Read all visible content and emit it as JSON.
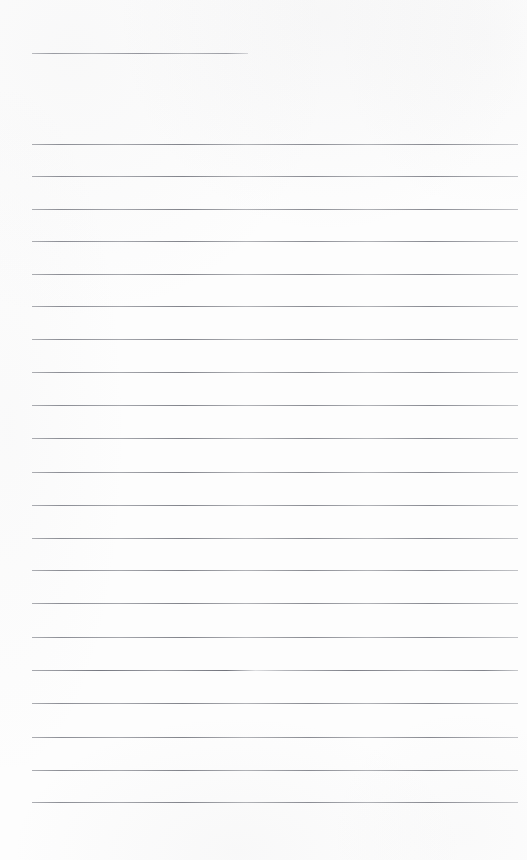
{
  "document": {
    "kind": "scanned-blank-ruled-page",
    "page_width": 527,
    "page_height": 860,
    "background_color": "#fdfdfd",
    "rule_color": "#8a8c94",
    "rule_thickness_px": 1,
    "left_margin_x": 32,
    "right_margin_x": 518,
    "line_spacing_px": 32.5,
    "total_rules": 22,
    "body_rule_count": 21,
    "title_rule_count": 1,
    "visible_text": ""
  },
  "title_rule": {
    "label": "title-blank",
    "x": 32,
    "y": 53,
    "width": 216,
    "variant": "title"
  },
  "body_rules": [
    {
      "label": "writing-line-1",
      "x": 32,
      "y": 144,
      "width": 486,
      "variant": "body"
    },
    {
      "label": "writing-line-2",
      "x": 32,
      "y": 176,
      "width": 486,
      "variant": "body"
    },
    {
      "label": "writing-line-3",
      "x": 32,
      "y": 209,
      "width": 486,
      "variant": "body"
    },
    {
      "label": "writing-line-4",
      "x": 32,
      "y": 241,
      "width": 486,
      "variant": "body"
    },
    {
      "label": "writing-line-5",
      "x": 32,
      "y": 274,
      "width": 486,
      "variant": "body"
    },
    {
      "label": "writing-line-6",
      "x": 32,
      "y": 306,
      "width": 486,
      "variant": "body"
    },
    {
      "label": "writing-line-7",
      "x": 32,
      "y": 339,
      "width": 486,
      "variant": "body"
    },
    {
      "label": "writing-line-8",
      "x": 32,
      "y": 372,
      "width": 486,
      "variant": "body"
    },
    {
      "label": "writing-line-9",
      "x": 32,
      "y": 405,
      "width": 486,
      "variant": "body"
    },
    {
      "label": "writing-line-10",
      "x": 32,
      "y": 438,
      "width": 486,
      "variant": "body"
    },
    {
      "label": "writing-line-11",
      "x": 32,
      "y": 472,
      "width": 486,
      "variant": "body"
    },
    {
      "label": "writing-line-12",
      "x": 32,
      "y": 505,
      "width": 486,
      "variant": "body"
    },
    {
      "label": "writing-line-13",
      "x": 32,
      "y": 538,
      "width": 486,
      "variant": "body"
    },
    {
      "label": "writing-line-14",
      "x": 32,
      "y": 570,
      "width": 486,
      "variant": "body"
    },
    {
      "label": "writing-line-15",
      "x": 32,
      "y": 603,
      "width": 486,
      "variant": "body"
    },
    {
      "label": "writing-line-16",
      "x": 32,
      "y": 637,
      "width": 486,
      "variant": "body"
    },
    {
      "label": "writing-line-17",
      "x": 32,
      "y": 670,
      "width": 486,
      "variant": "dense"
    },
    {
      "label": "writing-line-18",
      "x": 32,
      "y": 703,
      "width": 486,
      "variant": "body"
    },
    {
      "label": "writing-line-19",
      "x": 32,
      "y": 737,
      "width": 486,
      "variant": "body"
    },
    {
      "label": "writing-line-20",
      "x": 32,
      "y": 770,
      "width": 486,
      "variant": "body"
    },
    {
      "label": "writing-line-21",
      "x": 32,
      "y": 802,
      "width": 486,
      "variant": "body"
    }
  ]
}
